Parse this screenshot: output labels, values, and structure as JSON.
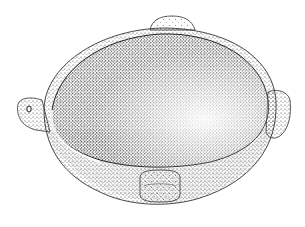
{
  "image": {
    "subject": "stippled illustration of a stone bowl with four lug handles",
    "features": [
      "oval bowl interior",
      "lug-handle-top",
      "lug-handle-left-pierced",
      "lug-handle-right",
      "lug-handle-front"
    ],
    "colors": {
      "background": "#ffffff",
      "ink": "#1a1a1a",
      "outline": "#333333"
    }
  }
}
